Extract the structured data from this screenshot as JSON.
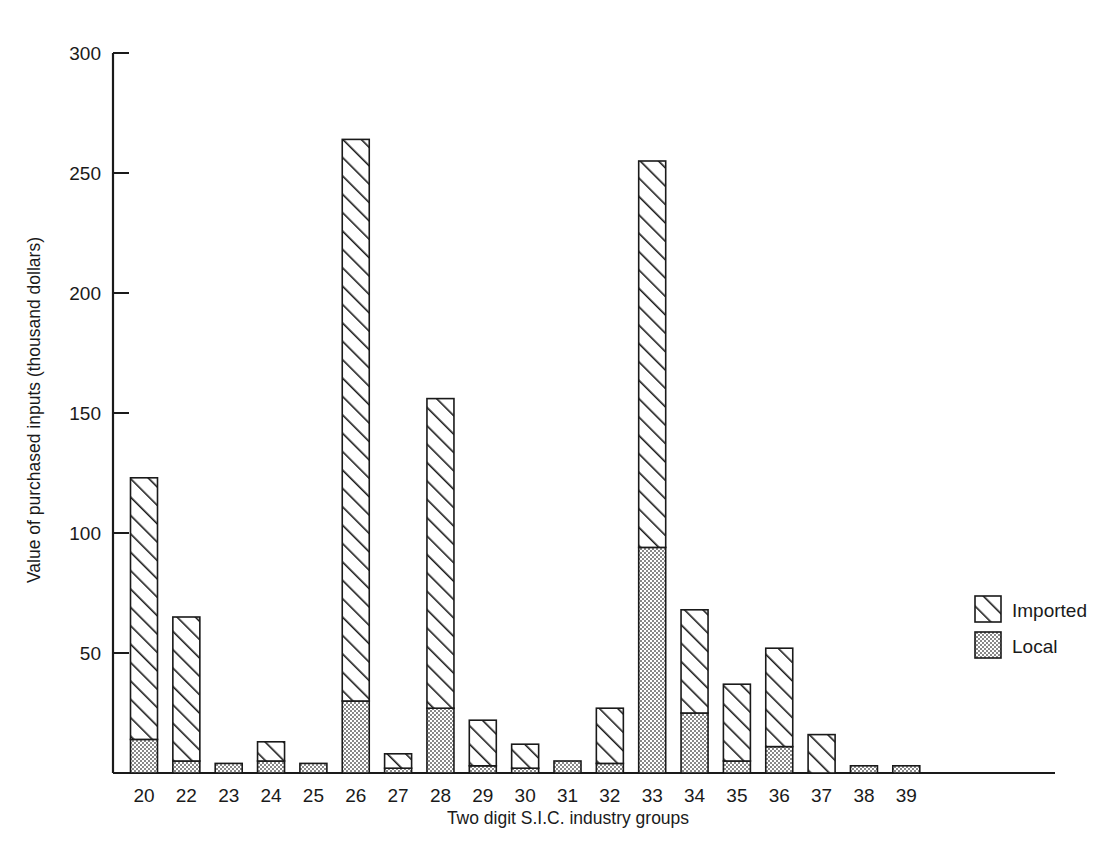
{
  "chart_data": {
    "type": "bar",
    "subtype": "stacked-bar",
    "title": "",
    "xlabel": "Two digit S.I.C. industry groups",
    "ylabel": "Value of purchased inputs (thousand dollars)",
    "categories": [
      "20",
      "22",
      "23",
      "24",
      "25",
      "26",
      "27",
      "28",
      "29",
      "30",
      "31",
      "32",
      "33",
      "34",
      "35",
      "36",
      "37",
      "38",
      "39"
    ],
    "series": [
      {
        "name": "Local",
        "values": [
          14,
          5,
          4,
          5,
          4,
          30,
          2,
          27,
          3,
          2,
          5,
          4,
          94,
          25,
          5,
          11,
          0,
          3,
          3
        ]
      },
      {
        "name": "Imported",
        "values": [
          109,
          60,
          0,
          8,
          0,
          234,
          6,
          129,
          19,
          10,
          0,
          23,
          161,
          43,
          32,
          41,
          16,
          0,
          0
        ]
      }
    ],
    "totals": [
      123,
      65,
      4,
      13,
      4,
      264,
      8,
      156,
      22,
      12,
      5,
      27,
      255,
      68,
      37,
      52,
      16,
      3,
      3
    ],
    "ylim": [
      0,
      300
    ],
    "yticks": [
      0,
      50,
      100,
      150,
      200,
      250,
      300
    ],
    "ytick_labels": [
      "",
      "50",
      "100",
      "150",
      "200",
      "250",
      "300"
    ],
    "grid": false,
    "legend_position": "right-middle",
    "legend": [
      {
        "label": "Imported",
        "pattern": "diagonal-hatch"
      },
      {
        "label": "Local",
        "pattern": "dotted-stipple"
      }
    ]
  },
  "colors": {
    "ink": "#1a1a1a",
    "background": "#ffffff",
    "local_fill": "#d9d9d9",
    "imported_fill": "#ffffff"
  }
}
